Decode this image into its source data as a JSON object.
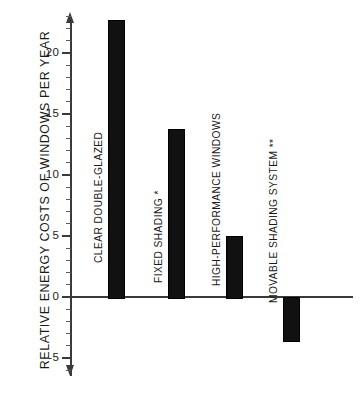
{
  "chart_data": {
    "type": "bar",
    "title": "",
    "subtitle": "",
    "xlabel": "",
    "ylabel": "RELATIVE  ENERGY  COSTS OF WINDOWS PER YEAR",
    "categories": [
      "CLEAR DOUBLE-GLAZED",
      "FIXED SHADING *",
      "HIGH-PERFORMANCE WINDOWS",
      "MOVABLE SHADING SYSTEM **"
    ],
    "values": [
      22.7,
      13.8,
      5.0,
      -3.5
    ],
    "ylim": [
      -6.3,
      23.2
    ],
    "yticks": [
      -5,
      0,
      5,
      10,
      15,
      20
    ],
    "ytick_labels": [
      "-5",
      "0",
      "5",
      "10",
      "15",
      "20"
    ],
    "minor_tick_step": 1,
    "grid": false,
    "legend": false,
    "bar_color": "#111111",
    "axis_color": "#3a3a3a",
    "background_color": "#ffffff",
    "zero_line": 0
  },
  "axis": {
    "y_title": "RELATIVE  ENERGY  COSTS OF WINDOWS PER YEAR",
    "ticks": [
      {
        "value": 20,
        "label": "20"
      },
      {
        "value": 15,
        "label": "15"
      },
      {
        "value": 10,
        "label": "10"
      },
      {
        "value": 5,
        "label": "5"
      },
      {
        "value": 0,
        "label": "0"
      },
      {
        "value": -5,
        "label": "-5"
      }
    ]
  },
  "bars": [
    {
      "label": "CLEAR DOUBLE-GLAZED",
      "value": 22.7
    },
    {
      "label": "FIXED SHADING *",
      "value": 13.8
    },
    {
      "label": "HIGH-PERFORMANCE WINDOWS",
      "value": 5.0
    },
    {
      "label": "MOVABLE SHADING SYSTEM **",
      "value": -3.5
    }
  ]
}
